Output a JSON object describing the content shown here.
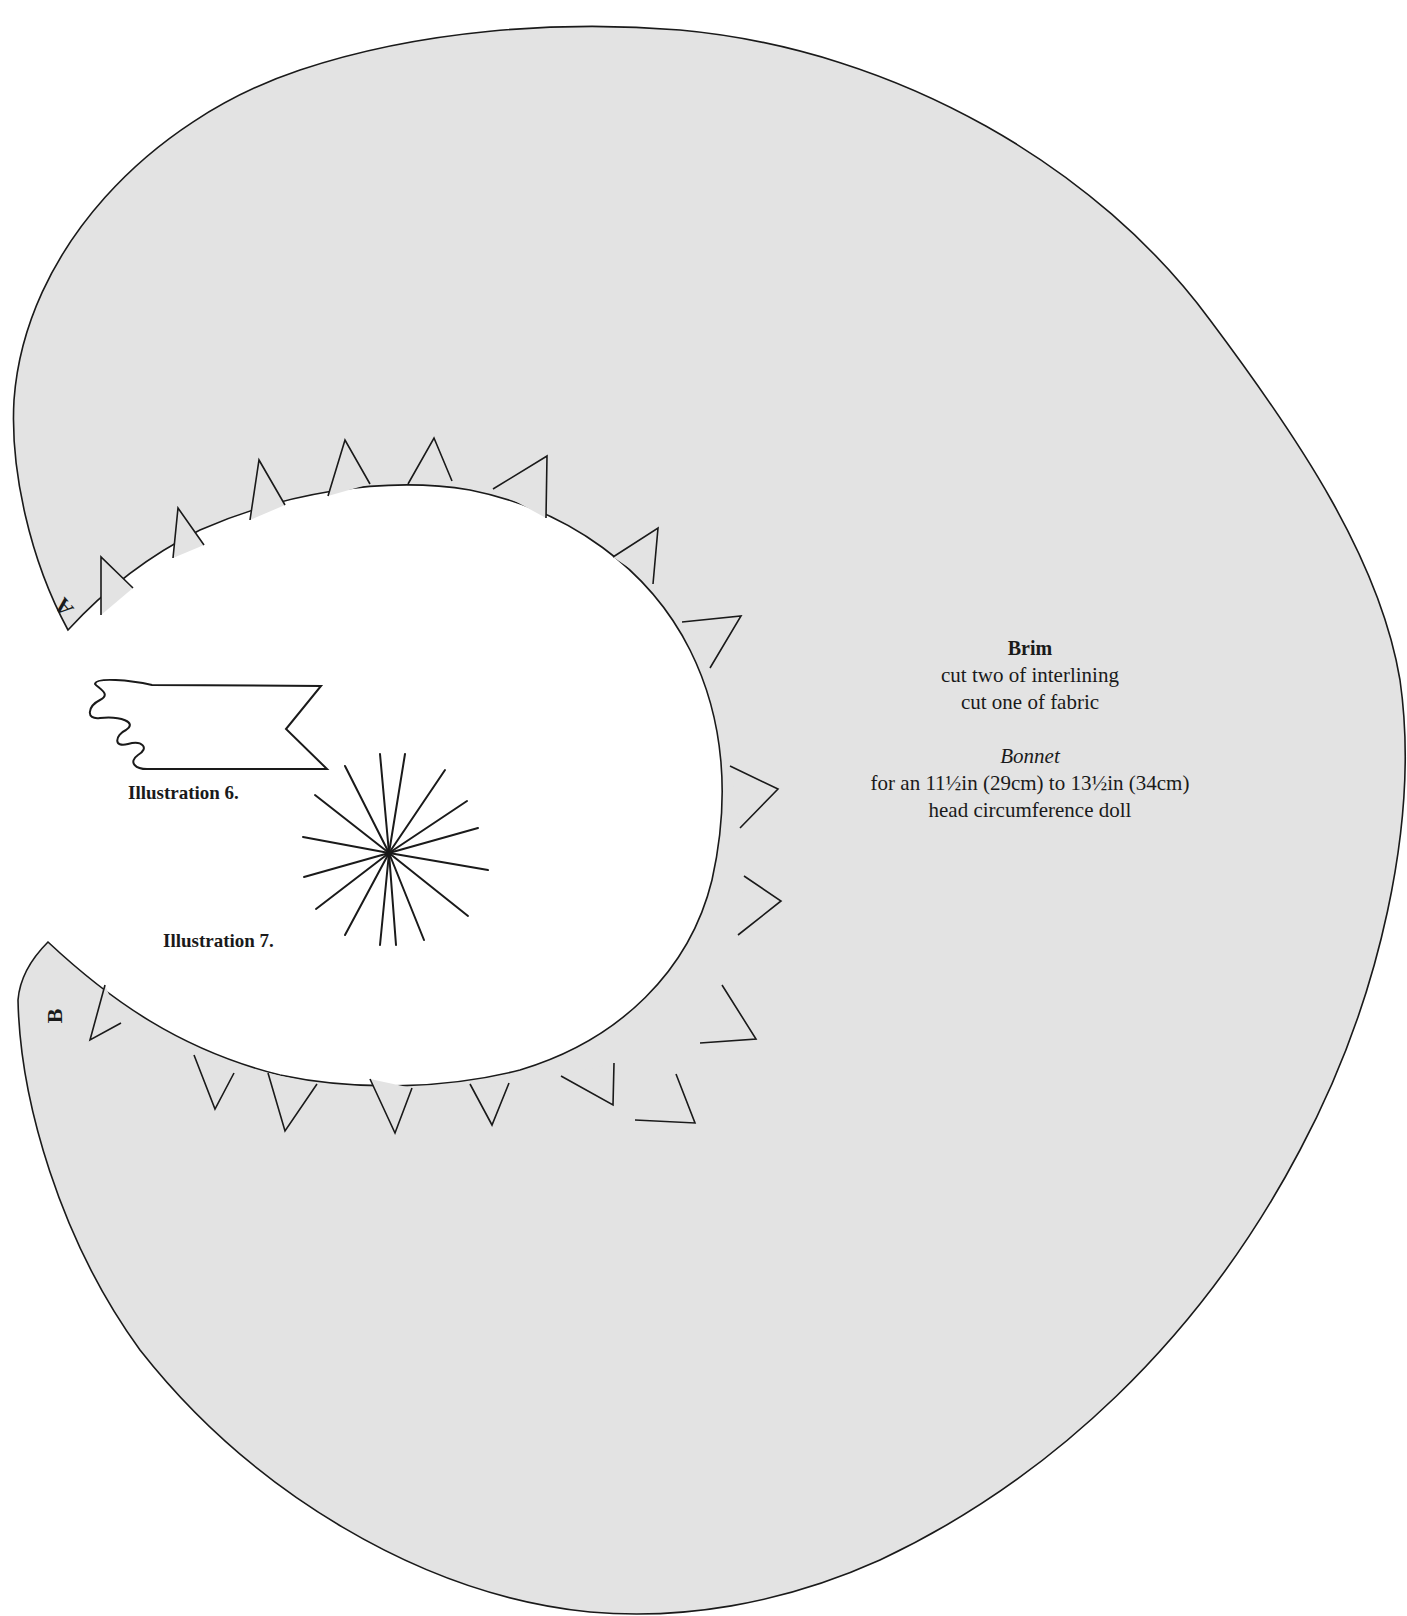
{
  "pattern_piece": {
    "title": "Brim",
    "instructions": [
      "cut two of interlining",
      "cut one of fabric"
    ],
    "garment": "Bonnet",
    "size_line": "for an 11½in (29cm) to 13½in (34cm)",
    "size_line_2": "head circumference doll"
  },
  "markers": {
    "a": "A",
    "b": "B"
  },
  "illustrations": [
    {
      "label": "Illustration 6."
    },
    {
      "label": "Illustration 7."
    }
  ],
  "colors": {
    "pattern_fill": "#e3e3e3",
    "outline": "#1a1a1a",
    "background": "#ffffff"
  }
}
